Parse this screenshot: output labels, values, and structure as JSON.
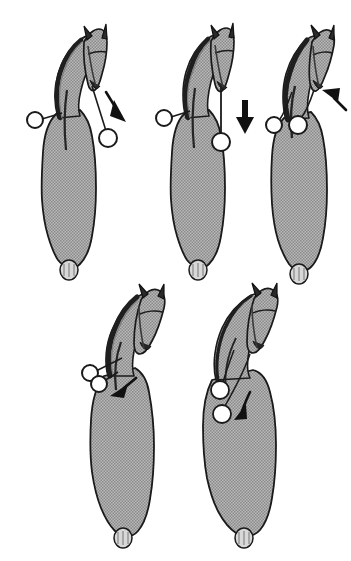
{
  "plate": {
    "title": "Horse viewed from above with rein ring positions",
    "background_color": "#ffffff",
    "width": 351,
    "height": 561,
    "panel_count": 5
  },
  "palette": {
    "body_fill": "#a8a8a8",
    "body_outline": "#1a1a1a",
    "mane_dark": "#1f1f1f",
    "ring_fill": "#ffffff",
    "ring_stroke": "#1a1a1a",
    "arrow_fill": "#111111",
    "line_stroke": "#1a1a1a",
    "tail_fill": "#d8d8d8"
  },
  "figures": [
    {
      "id": "figure-1",
      "label": "top-left",
      "position": {
        "left": 18,
        "top": 18
      },
      "head_turn": "curved-left-neck-head-forward",
      "ring_count": 2,
      "rings": [
        {
          "name": "left-rein-ring",
          "side": "left",
          "cx": 20,
          "cy": 102,
          "r": 8,
          "style": "open"
        },
        {
          "name": "right-rein-ring",
          "side": "right",
          "cx": 86,
          "cy": 118,
          "r": 9,
          "style": "open"
        }
      ],
      "arrow": {
        "name": "direction-arrow",
        "direction": "down-right",
        "angle_deg": 55,
        "style": "straight"
      },
      "tail": true
    },
    {
      "id": "figure-2",
      "label": "top-middle",
      "position": {
        "left": 148,
        "top": 18
      },
      "head_turn": "straight-neck-head-forward",
      "ring_count": 2,
      "rings": [
        {
          "name": "left-rein-ring",
          "side": "left",
          "cx": 20,
          "cy": 100,
          "r": 8,
          "style": "open"
        },
        {
          "name": "right-rein-ring",
          "side": "right",
          "cx": 72,
          "cy": 122,
          "r": 9,
          "style": "open"
        }
      ],
      "arrow": {
        "name": "direction-arrow",
        "direction": "down",
        "angle_deg": 90,
        "style": "straight-thick"
      },
      "tail": true
    },
    {
      "id": "figure-3",
      "label": "top-right",
      "position": {
        "left": 258,
        "top": 18
      },
      "head_turn": "head-tilted-right",
      "ring_count": 2,
      "rings": [
        {
          "name": "left-rein-ring",
          "side": "left",
          "cx": 14,
          "cy": 106,
          "r": 8,
          "style": "open"
        },
        {
          "name": "right-rein-ring",
          "side": "right",
          "cx": 40,
          "cy": 106,
          "r": 9,
          "style": "open"
        }
      ],
      "arrow": {
        "name": "direction-arrow",
        "direction": "up-left",
        "angle_deg": 200,
        "style": "straight"
      },
      "tail": true
    },
    {
      "id": "figure-4",
      "label": "bottom-left",
      "position": {
        "left": 78,
        "top": 280
      },
      "head_turn": "head-turned-right-neck-bent",
      "ring_count": 2,
      "rings": [
        {
          "name": "upper-rein-ring",
          "side": "left",
          "cx": 13,
          "cy": 92,
          "r": 8,
          "style": "open"
        },
        {
          "name": "lower-rein-ring",
          "side": "left",
          "cx": 22,
          "cy": 102,
          "r": 8,
          "style": "open"
        }
      ],
      "arrow": {
        "name": "direction-arrow",
        "direction": "down-left",
        "angle_deg": 200,
        "style": "straight"
      },
      "tail": true
    },
    {
      "id": "figure-5",
      "label": "bottom-right",
      "position": {
        "left": 198,
        "top": 280
      },
      "head_turn": "head-turned-right-neck-bent",
      "ring_count": 2,
      "rings": [
        {
          "name": "upper-rein-ring",
          "side": "on-body",
          "cx": 22,
          "cy": 108,
          "r": 9,
          "style": "filled-white"
        },
        {
          "name": "lower-rein-ring",
          "side": "on-body",
          "cx": 24,
          "cy": 130,
          "r": 9,
          "style": "filled-white"
        }
      ],
      "arrow": {
        "name": "direction-arrow",
        "direction": "down-left",
        "angle_deg": 215,
        "style": "curved"
      },
      "tail": true
    }
  ],
  "captions": []
}
